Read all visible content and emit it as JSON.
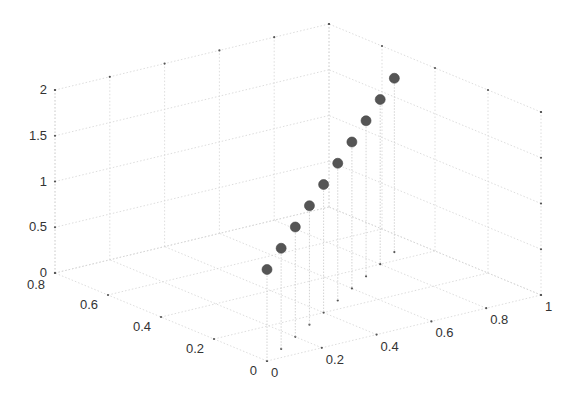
{
  "chart_data": {
    "type": "scatter3d",
    "title": "",
    "xlabel": "",
    "ylabel": "",
    "zlabel": "",
    "stems": true,
    "grid": true,
    "xlim": [
      0,
      1
    ],
    "ylim": [
      0,
      0.8
    ],
    "zlim": [
      0,
      2
    ],
    "x_ticks": [
      "0",
      "0.2",
      "0.4",
      "0.6",
      "0.8",
      "1"
    ],
    "y_ticks": [
      "0",
      "0.2",
      "0.4",
      "0.6",
      "0.8"
    ],
    "z_ticks": [
      "0",
      "0.5",
      "1",
      "1.5",
      "2"
    ],
    "marker_color": "#555555",
    "points": [
      {
        "x": 0.0,
        "y": 0.0,
        "z": 1.0
      },
      {
        "x": 0.1,
        "y": 0.05,
        "z": 1.1
      },
      {
        "x": 0.2,
        "y": 0.1,
        "z": 1.2
      },
      {
        "x": 0.3,
        "y": 0.15,
        "z": 1.3
      },
      {
        "x": 0.4,
        "y": 0.2,
        "z": 1.4
      },
      {
        "x": 0.5,
        "y": 0.25,
        "z": 1.5
      },
      {
        "x": 0.6,
        "y": 0.3,
        "z": 1.6
      },
      {
        "x": 0.7,
        "y": 0.35,
        "z": 1.7
      },
      {
        "x": 0.8,
        "y": 0.4,
        "z": 1.8
      },
      {
        "x": 0.9,
        "y": 0.45,
        "z": 1.9
      }
    ]
  }
}
